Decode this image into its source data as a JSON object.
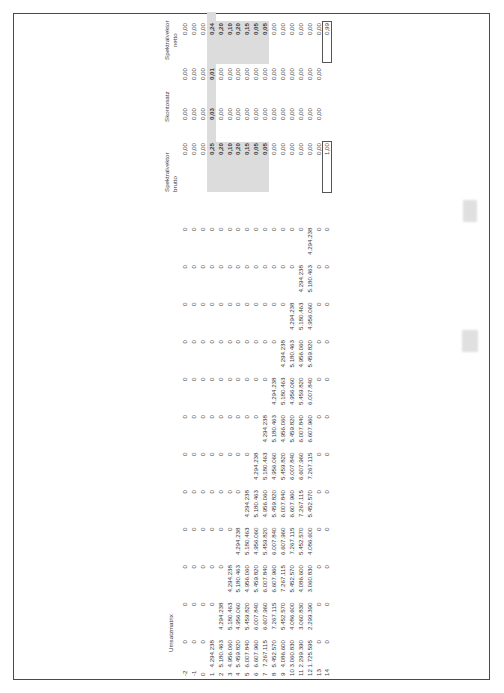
{
  "document": {
    "orientation": "rotated-90-ccw",
    "sections": {
      "umsatzmatrix": {
        "title": "Umsatzmatrix",
        "row_labels": [
          "-2",
          "-1",
          "0",
          "1",
          "2",
          "3",
          "4",
          "5",
          "6",
          "7",
          "8",
          "9",
          "10",
          "11",
          "12",
          "13",
          "14"
        ],
        "columns": [
          [
            "0",
            "0",
            "0",
            "4.294.238",
            "5.180.463",
            "4.956.060",
            "5.459.820",
            "6.007.840",
            "6.607.960",
            "7.267.115",
            "5.452.570",
            "4.086.600",
            "3.060.830",
            "2.299.390",
            "1.725.595",
            "0",
            "0"
          ],
          [
            "0",
            "0",
            "0",
            "0",
            "4.294.238",
            "5.180.463",
            "4.956.060",
            "5.459.820",
            "6.007.840",
            "6.607.960",
            "7.267.115",
            "5.452.570",
            "4.086.600",
            "3.060.830",
            "2.299.390",
            "0",
            "0"
          ],
          [
            "0",
            "0",
            "0",
            "0",
            "0",
            "4.294.238",
            "5.180.463",
            "4.956.060",
            "5.459.820",
            "6.007.840",
            "6.607.960",
            "7.267.115",
            "5.452.570",
            "4.086.600",
            "3.060.830",
            "0",
            "0"
          ],
          [
            "0",
            "0",
            "0",
            "0",
            "0",
            "0",
            "4.294.238",
            "5.180.463",
            "4.956.060",
            "5.459.820",
            "6.007.840",
            "6.607.960",
            "7.267.115",
            "5.452.570",
            "4.086.600",
            "0",
            "0"
          ],
          [
            "0",
            "0",
            "0",
            "0",
            "0",
            "0",
            "0",
            "4.294.238",
            "5.180.463",
            "4.956.060",
            "5.459.820",
            "6.007.840",
            "6.607.960",
            "7.267.115",
            "5.452.570",
            "0",
            "0"
          ],
          [
            "0",
            "0",
            "0",
            "0",
            "0",
            "0",
            "0",
            "0",
            "4.294.238",
            "5.180.463",
            "4.956.060",
            "5.459.820",
            "6.007.840",
            "6.607.960",
            "7.267.115",
            "0",
            "0"
          ],
          [
            "0",
            "0",
            "0",
            "0",
            "0",
            "0",
            "0",
            "0",
            "0",
            "4.294.238",
            "5.180.463",
            "4.956.060",
            "5.459.820",
            "6.007.840",
            "6.607.960",
            "0",
            "0"
          ],
          [
            "0",
            "0",
            "0",
            "0",
            "0",
            "0",
            "0",
            "0",
            "0",
            "0",
            "4.294.238",
            "5.180.463",
            "4.956.060",
            "5.459.820",
            "6.007.840",
            "0",
            "0"
          ],
          [
            "0",
            "0",
            "0",
            "0",
            "0",
            "0",
            "0",
            "0",
            "0",
            "0",
            "0",
            "4.294.238",
            "5.180.463",
            "4.956.060",
            "5.459.820",
            "0",
            "0"
          ],
          [
            "0",
            "0",
            "0",
            "0",
            "0",
            "0",
            "0",
            "0",
            "0",
            "0",
            "0",
            "0",
            "4.294.238",
            "5.180.463",
            "4.956.060",
            "0",
            "0"
          ],
          [
            "0",
            "0",
            "0",
            "0",
            "0",
            "0",
            "0",
            "0",
            "0",
            "0",
            "0",
            "0",
            "0",
            "4.294.238",
            "5.180.463",
            "0",
            "0"
          ],
          [
            "0",
            "0",
            "0",
            "0",
            "0",
            "0",
            "0",
            "0",
            "0",
            "0",
            "0",
            "0",
            "0",
            "0",
            "4.294.238",
            "0",
            "0"
          ]
        ]
      },
      "spektralvektor_brutto": {
        "title_line1": "Spektralvektor",
        "title_line2": "brutto",
        "values": [
          "0,00",
          "0,00",
          "0,00",
          "0,25",
          "0,20",
          "0,10",
          "0,20",
          "0,15",
          "0,05",
          "0,05",
          "0,00",
          "0,00",
          "0,00",
          "0,00",
          "0,00",
          "0,00"
        ],
        "total": "1,00"
      },
      "skontosatz": {
        "title": "Skontosatz",
        "values": [
          "0,00",
          "0,00",
          "0,00",
          "0,03",
          "0,00",
          "0,00",
          "0,00",
          "0,00",
          "0,00",
          "0,00",
          "0,00",
          "0,00",
          "0,00",
          "0,00",
          "0,00",
          "0,00"
        ]
      },
      "skonto_betrag": {
        "values": [
          "0,00",
          "0,00",
          "0,00",
          "0,01",
          "0,00",
          "0,00",
          "0,00",
          "0,00",
          "0,00",
          "0,00",
          "0,00",
          "0,00",
          "0,00",
          "0,00",
          "0,00",
          "0,00"
        ]
      },
      "spektralvektor_netto": {
        "title_line1": "Spektralvektor",
        "title_line2": "netto",
        "values": [
          "0,00",
          "0,00",
          "0,00",
          "0,24",
          "0,20",
          "0,10",
          "0,20",
          "0,15",
          "0,05",
          "0,05",
          "0,00",
          "0,00",
          "0,00",
          "0,00",
          "0,00",
          "0,00"
        ],
        "total": "0,99"
      }
    },
    "colors": {
      "shade": "#dcdcdc",
      "border": "#4a4a4a",
      "text": "#3a3a3a"
    }
  }
}
